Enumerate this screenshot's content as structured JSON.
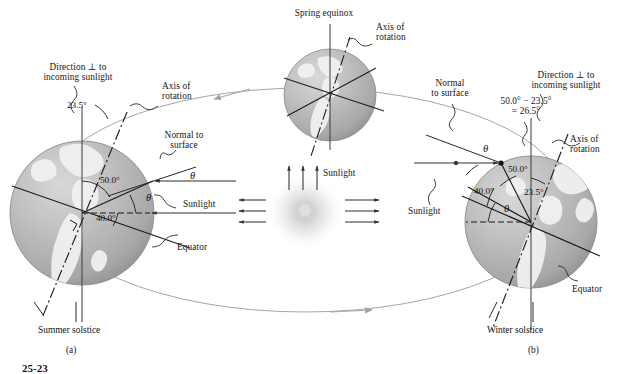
{
  "figure": {
    "number": "25-23",
    "kind": "physics-textbook-diagram"
  },
  "sun": {
    "label": "Sunlight",
    "glow_color": "#dcdcdc",
    "core_color": "#cfcfcf"
  },
  "orbit": {
    "stroke": "#9a9a9a",
    "direction": "counterclockwise"
  },
  "earth": {
    "body_color": "#b4b4b4",
    "land_color": "#f0f0f0",
    "outline_color": "#8c8c8c"
  },
  "top": {
    "caption": "Spring equinox",
    "axis_label": "Axis of\nrotation"
  },
  "left": {
    "caption": "Summer solstice",
    "panel_letter": "(a)",
    "perp_label": "Direction ⊥ to\nincoming sunlight",
    "axis_label": "Axis of\nrotation",
    "normal_label": "Normal to\nsurface",
    "sunlight_label": "Sunlight",
    "equator_label": "Equator",
    "tilt_angle": "23.5°",
    "upper_angle": "50.0°",
    "lower_angle": "40.0°",
    "theta_upper": "θ",
    "theta_lower": "θ"
  },
  "right": {
    "caption": "Winter solstice",
    "panel_letter": "(b)",
    "perp_label": "Direction ⊥ to\nincoming sunlight",
    "axis_label": "Axis of\nrotation",
    "normal_label": "Normal\nto surface",
    "sunlight_label": "Sunlight",
    "equator_label": "Equator",
    "computed_angle": "50.0° − 23.5°\n= 26.5°",
    "tilt_angle": "23.5°",
    "upper_angle": "50.0°",
    "lower_angle": "40.0°",
    "theta_upper": "θ",
    "theta_lower": "θ"
  }
}
